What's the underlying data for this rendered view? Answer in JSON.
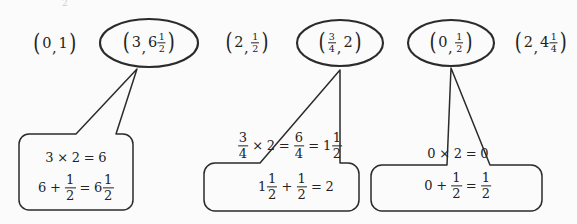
{
  "figure": {
    "background_color": "#fbfbfb",
    "ink_color": "#232323",
    "stray_mark": "2",
    "pairs": [
      {
        "name": "pair-0-1",
        "x": "0",
        "y": "1",
        "circled": false
      },
      {
        "name": "pair-3-6half",
        "x": "3",
        "y": "6 1/2",
        "circled": true
      },
      {
        "name": "pair-2-half",
        "x": "2",
        "y": "1/2",
        "circled": false
      },
      {
        "name": "pair-3q-2",
        "x": "3/4",
        "y": "2",
        "circled": true
      },
      {
        "name": "pair-0-half",
        "x": "0",
        "y": "1/2",
        "circled": true
      },
      {
        "name": "pair-2-4quart",
        "x": "2",
        "y": "4 1/4",
        "circled": false
      }
    ],
    "callouts": [
      {
        "name": "callout-3-6half",
        "line1": "3 × 2 = 6",
        "line2": "6 + 1/2 = 6 1/2"
      },
      {
        "name": "callout-3q-2",
        "line1": "3/4 × 2 = 6/4 = 1 1/2",
        "line2": "1 1/2 + 1/2 = 2"
      },
      {
        "name": "callout-0-half",
        "line1": "0 × 2 = 0",
        "line2": "0 + 1/2 = 1/2"
      }
    ]
  }
}
